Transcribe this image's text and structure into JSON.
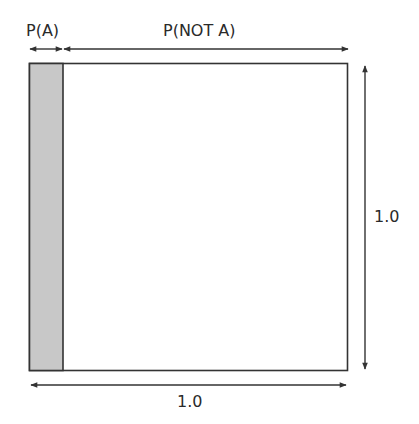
{
  "diagram": {
    "labels": {
      "p_a": "P(A)",
      "p_not_a": "P(NOT A)",
      "height": "1.0",
      "width": "1.0"
    },
    "colors": {
      "outline": "#333333",
      "shaded_region": "#c8c8c8",
      "unshaded_region": "#ffffff",
      "arrow": "#333333"
    },
    "geometry": {
      "square": {
        "x": 29,
        "y": 63,
        "width": 319,
        "height": 308
      },
      "shaded_strip": {
        "x": 29,
        "y": 63,
        "width": 34,
        "height": 308
      }
    },
    "regions": [
      {
        "name": "A",
        "proportion_label": "P(A)",
        "shaded": true
      },
      {
        "name": "NOT A",
        "proportion_label": "P(NOT A)",
        "shaded": false
      }
    ]
  }
}
